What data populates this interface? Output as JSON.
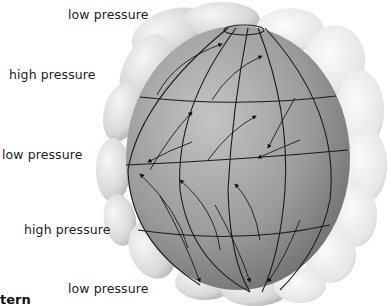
{
  "diagram": {
    "type": "global atmospheric circulation cells",
    "labels": [
      {
        "id": "top",
        "text": "low pressure"
      },
      {
        "id": "upper",
        "text": "high pressure"
      },
      {
        "id": "equator",
        "text": "low pressure"
      },
      {
        "id": "lower",
        "text": "high pressure"
      },
      {
        "id": "bottom",
        "text": "low pressure"
      }
    ],
    "caption": "tern",
    "colors": {
      "globe_light": "#b8b8b8",
      "globe_dark": "#6e6e6e",
      "cells": "#e6e6e6",
      "lines": "#1a1a1a"
    }
  }
}
